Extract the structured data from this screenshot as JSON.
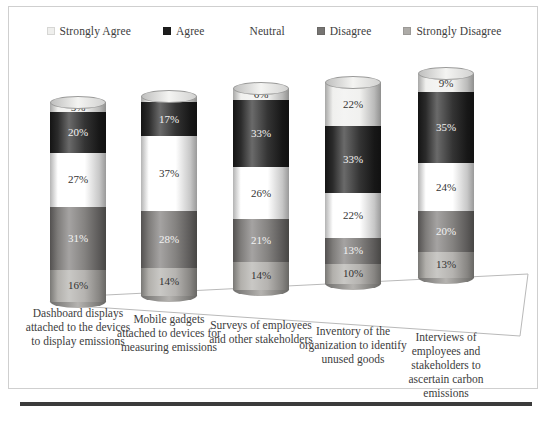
{
  "chart_data": {
    "type": "bar",
    "subtype": "100% stacked cylinder (3D)",
    "title": "",
    "xlabel": "",
    "ylabel": "",
    "ylim": [
      0,
      100
    ],
    "grid": false,
    "legend_position": "top-center",
    "categories": [
      "Dashboard displays attached to the devices to display emissions",
      "Mobile gadgets attached to devices for measuring emissions",
      "Surveys of employees and other stakeholders",
      "Inventory of the organization to identify unused goods",
      "Interviews of employees and stakeholders to ascertain carbon emissions"
    ],
    "series": [
      {
        "name": "Strongly Agree",
        "color": "#efefed",
        "values": [
          5,
          3,
          6,
          22,
          9
        ],
        "labels": [
          "5%",
          "3%",
          "6%",
          "22%",
          "9%"
        ]
      },
      {
        "name": "Agree",
        "color": "#1d1d1d",
        "values": [
          20,
          17,
          33,
          33,
          35
        ],
        "labels": [
          "20%",
          "17%",
          "33%",
          "33%",
          "35%"
        ]
      },
      {
        "name": "Neutral",
        "color": "#ffffff",
        "values": [
          27,
          37,
          26,
          22,
          24
        ],
        "labels": [
          "27%",
          "37%",
          "26%",
          "22%",
          "24%"
        ]
      },
      {
        "name": "Disagree",
        "color": "#767472",
        "values": [
          31,
          28,
          21,
          13,
          20
        ],
        "labels": [
          "31%",
          "28%",
          "21%",
          "13%",
          "20%"
        ]
      },
      {
        "name": "Strongly Disagree",
        "color": "#adaba7",
        "values": [
          16,
          14,
          14,
          10,
          13
        ],
        "labels": [
          "16%",
          "14%",
          "14%",
          "10%",
          "13%"
        ]
      }
    ]
  },
  "legend": {
    "items": [
      {
        "label": "Strongly Agree",
        "color": "#efefed"
      },
      {
        "label": "Agree",
        "color": "#1d1d1d"
      },
      {
        "label": "Neutral",
        "color": "#ffffff"
      },
      {
        "label": "Disagree",
        "color": "#767472"
      },
      {
        "label": "Strongly Disagree",
        "color": "#adaba7"
      }
    ]
  },
  "axis_labels": {
    "cat0": "Dashboard displays attached to the devices to display emissions",
    "cat1": "Mobile gadgets attached to devices for measuring emissions",
    "cat2": "Surveys of employees and other stakeholders",
    "cat3": "Inventory of the organization to identify unused goods",
    "cat4": "Interviews of employees and stakeholders to ascertain carbon emissions"
  }
}
